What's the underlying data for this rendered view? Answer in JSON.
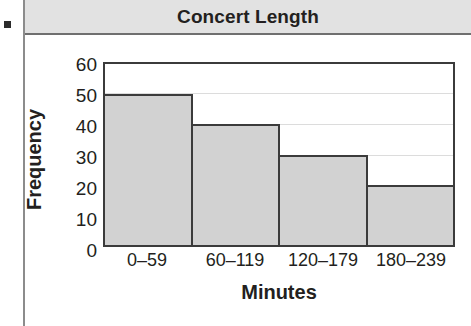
{
  "bullet": {
    "name": "bullet-marker"
  },
  "header": {
    "title": "Concert Length"
  },
  "chart_data": {
    "type": "bar",
    "title": "Concert Length",
    "categories": [
      "0–59",
      "60–119",
      "120–179",
      "180–239"
    ],
    "values": [
      50,
      40,
      30,
      20
    ],
    "xlabel": "Minutes",
    "ylabel": "Frequency",
    "ylim": [
      0,
      60
    ],
    "ytick_labels": [
      "60",
      "50",
      "40",
      "30",
      "20",
      "10",
      "0"
    ],
    "ytick_values": [
      60,
      50,
      40,
      30,
      20,
      10,
      0
    ],
    "grid": true,
    "legend": null,
    "bar_fill_color": "#d2d2d2",
    "bar_edge_color": "#3b3b3b",
    "header_band_color": "#e2e2e2"
  }
}
